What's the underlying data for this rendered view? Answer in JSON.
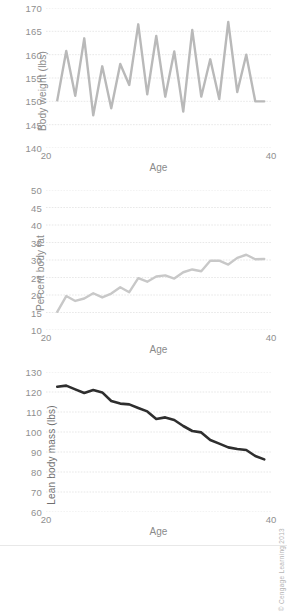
{
  "figure": {
    "credit": "© Cengage Learning 2013"
  },
  "chart_data": [
    {
      "type": "line",
      "title": "",
      "xlabel": "Age",
      "ylabel": "Body weight (lbs)",
      "xlim": [
        20,
        40
      ],
      "ylim": [
        140,
        170
      ],
      "xticks": [
        20,
        40
      ],
      "xticklabels": [
        "20",
        "40"
      ],
      "yticks": [
        140,
        145,
        150,
        155,
        160,
        165,
        170
      ],
      "yticklabels": [
        "140",
        "145",
        "150",
        "155",
        "160",
        "165",
        "170"
      ],
      "grid": true,
      "legend": false,
      "color": "#b9b9b9",
      "linewidth": 2.4,
      "x": [
        21,
        21.8,
        22.6,
        23.4,
        24.2,
        25,
        25.8,
        26.6,
        27.4,
        28.2,
        29,
        29.8,
        30.6,
        31.4,
        32.2,
        33,
        33.8,
        34.6,
        35.4,
        36.2,
        37,
        37.8,
        38.6,
        39.4
      ],
      "values": [
        150.2,
        160.8,
        151.2,
        163.5,
        147.0,
        157.5,
        148.5,
        158.0,
        153.5,
        166.5,
        151.5,
        164.0,
        151.0,
        160.7,
        147.8,
        165.3,
        151.0,
        159.0,
        150.5,
        167.0,
        152.0,
        160.0,
        150.0,
        150.0
      ]
    },
    {
      "type": "line",
      "title": "",
      "xlabel": "Age",
      "ylabel": "Percent body fat",
      "xlim": [
        20,
        40
      ],
      "ylim": [
        10,
        50
      ],
      "xticks": [
        20,
        40
      ],
      "xticklabels": [
        "20",
        "40"
      ],
      "yticks": [
        10,
        15,
        20,
        25,
        30,
        35,
        40,
        45,
        50
      ],
      "yticklabels": [
        "10",
        "15",
        "20",
        "25",
        "30",
        "35",
        "40",
        "45",
        "50"
      ],
      "grid": true,
      "legend": false,
      "color": "#c8c8c8",
      "linewidth": 2.4,
      "x": [
        21,
        21.8,
        22.6,
        23.4,
        24.2,
        25,
        25.8,
        26.6,
        27.4,
        28.2,
        29,
        29.8,
        30.6,
        31.4,
        32.2,
        33,
        33.8,
        34.6,
        35.4,
        36.2,
        37,
        37.8,
        38.6,
        39.4
      ],
      "values": [
        15.2,
        19.7,
        18.3,
        19.0,
        20.5,
        19.3,
        20.4,
        22.2,
        20.8,
        24.8,
        23.8,
        25.3,
        25.6,
        24.7,
        26.5,
        27.3,
        26.8,
        29.8,
        29.8,
        28.7,
        30.6,
        31.5,
        30.2,
        30.3
      ]
    },
    {
      "type": "line",
      "title": "",
      "xlabel": "Age",
      "ylabel": "Lean body mass (lbs)",
      "xlim": [
        20,
        40
      ],
      "ylim": [
        60,
        130
      ],
      "xticks": [
        20,
        40
      ],
      "xticklabels": [
        "20",
        "40"
      ],
      "yticks": [
        60,
        70,
        80,
        90,
        100,
        110,
        120,
        130
      ],
      "yticklabels": [
        "60",
        "70",
        "80",
        "90",
        "100",
        "110",
        "120",
        "130"
      ],
      "grid": true,
      "legend": false,
      "color": "#2e2e2e",
      "linewidth": 2.6,
      "x": [
        21,
        21.8,
        22.6,
        23.4,
        24.2,
        25,
        25.8,
        26.6,
        27.4,
        28.2,
        29,
        29.8,
        30.6,
        31.4,
        32.2,
        33,
        33.8,
        34.6,
        35.4,
        36.2,
        37,
        37.8,
        38.6,
        39.4
      ],
      "values": [
        122.6,
        123.2,
        121.3,
        119.5,
        121.0,
        119.8,
        115.5,
        114.2,
        113.8,
        112.0,
        110.3,
        106.5,
        107.3,
        106.0,
        103.0,
        100.5,
        99.8,
        96.0,
        94.2,
        92.3,
        91.5,
        91.0,
        88.0,
        86.3
      ]
    }
  ]
}
